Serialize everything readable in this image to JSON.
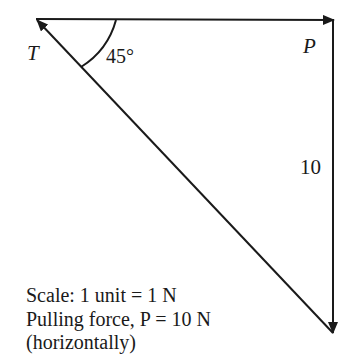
{
  "diagram": {
    "type": "vector triangle of forces",
    "vectors": [
      {
        "label": "P",
        "direction": "horizontal right",
        "length_units": 10
      },
      {
        "label": "10",
        "direction": "vertical down",
        "length_units": 10
      },
      {
        "label": "T",
        "direction": "diagonal up-left",
        "angle_with_horizontal": "45°"
      }
    ],
    "labels": {
      "T": "T",
      "P": "P",
      "side": "10",
      "angle": "45°"
    },
    "notes": {
      "line1": "Scale: 1 unit = 1 N",
      "line2": "Pulling force, P = 10 N",
      "line3": "(horizontally)"
    },
    "colors": {
      "stroke": "#1a1a1a",
      "background": "#ffffff"
    }
  }
}
